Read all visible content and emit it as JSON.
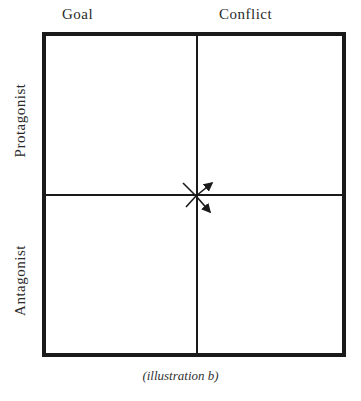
{
  "diagram": {
    "columns": [
      {
        "label": "Goal"
      },
      {
        "label": "Conflict"
      }
    ],
    "rows": [
      {
        "label": "Protagonist"
      },
      {
        "label": "Antagonist"
      }
    ],
    "center_marker": "crossed-arrows",
    "caption": "(illustration b)"
  }
}
